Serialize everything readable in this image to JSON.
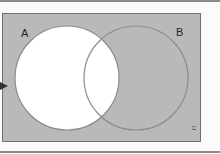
{
  "diagram": {
    "type": "venn",
    "sets": [
      {
        "label": "A",
        "shaded": false
      },
      {
        "label": "B",
        "shaded": true
      }
    ],
    "universe_label": "U",
    "shaded_region": "complement of A",
    "colors": {
      "universe_fill": "#b9b9b9",
      "set_a_fill": "#ffffff",
      "outline": "#8a8a8a",
      "border": "#6f6f6f",
      "arrow": "#333333"
    }
  }
}
